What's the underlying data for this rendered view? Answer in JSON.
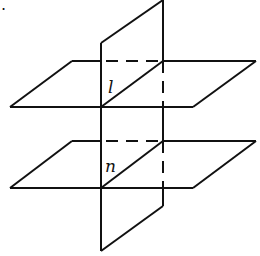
{
  "figure": {
    "corner_mark": ".",
    "labels": {
      "line_upper": "l",
      "line_lower": "n"
    },
    "stroke_color": "#111111",
    "background": "#ffffff"
  }
}
